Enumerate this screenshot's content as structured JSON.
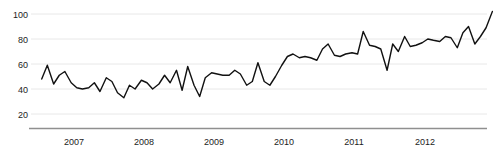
{
  "chart_data": {
    "type": "line",
    "title": "",
    "subtitle": "",
    "xlabel": "",
    "ylabel": "",
    "xlim": [
      2006.5,
      2013.0
    ],
    "ylim": [
      10,
      105
    ],
    "ytick_values": [
      100,
      80,
      60,
      40,
      20
    ],
    "ytick_labels": [
      "100",
      "80",
      "60",
      "40",
      "20"
    ],
    "xtick_values": [
      2007,
      2008,
      2009,
      2010,
      2011,
      2012
    ],
    "xtick_labels": [
      "2007",
      "2008",
      "2009",
      "2010",
      "2011",
      "2012"
    ],
    "grid": true,
    "grid_axis": "y",
    "grid_color": "#e8e8e8",
    "legend": false,
    "legend_position": "none",
    "line_color": "#111111",
    "line_width": 1.4,
    "axis_color": "#9a9a9a",
    "background": "#ffffff",
    "series": [
      {
        "name": "series-1",
        "x": [
          2006.54,
          2006.62,
          2006.71,
          2006.79,
          2006.87,
          2006.96,
          2007.04,
          2007.12,
          2007.21,
          2007.29,
          2007.37,
          2007.46,
          2007.54,
          2007.62,
          2007.71,
          2007.79,
          2007.87,
          2007.96,
          2008.04,
          2008.12,
          2008.21,
          2008.29,
          2008.37,
          2008.46,
          2008.54,
          2008.62,
          2008.71,
          2008.79,
          2008.87,
          2008.96,
          2009.04,
          2009.12,
          2009.21,
          2009.29,
          2009.37,
          2009.46,
          2009.54,
          2009.62,
          2009.71,
          2009.79,
          2009.87,
          2009.96,
          2010.04,
          2010.12,
          2010.21,
          2010.29,
          2010.37,
          2010.46,
          2010.54,
          2010.62,
          2010.71,
          2010.79,
          2010.87,
          2010.96,
          2011.04,
          2011.12,
          2011.21,
          2011.29,
          2011.37,
          2011.46,
          2011.54,
          2011.62,
          2011.71,
          2011.79,
          2011.87,
          2011.96,
          2012.04,
          2012.12,
          2012.21,
          2012.29,
          2012.37,
          2012.46,
          2012.54,
          2012.62,
          2012.71,
          2012.79,
          2012.87,
          2012.96
        ],
        "values": [
          48,
          59,
          44,
          51,
          54,
          45,
          41,
          40,
          41,
          45,
          38,
          49,
          46,
          37,
          33,
          43,
          40,
          47,
          45,
          40,
          44,
          51,
          45,
          55,
          39,
          58,
          43,
          34,
          49,
          53,
          52,
          51,
          51,
          55,
          52,
          43,
          46,
          61,
          46,
          43,
          50,
          59,
          66,
          68,
          65,
          66,
          65,
          63,
          72,
          76,
          67,
          66,
          68,
          69,
          68,
          86,
          75,
          74,
          72,
          55,
          76,
          70,
          82,
          74,
          75,
          77,
          80,
          79,
          78,
          82,
          81,
          73,
          85,
          90,
          76,
          82,
          89,
          102
        ]
      }
    ],
    "annotations": []
  },
  "axes": {
    "y_ticks": [
      {
        "label": "100",
        "top": 10,
        "value": 100
      },
      {
        "label": "80",
        "top": 35,
        "value": 80
      },
      {
        "label": "60",
        "top": 60,
        "value": 60
      },
      {
        "label": "40",
        "top": 85,
        "value": 40
      },
      {
        "label": "20",
        "top": 110,
        "value": 20
      }
    ],
    "x_ticks": [
      {
        "label": "2007",
        "left": 54,
        "value": 2007
      },
      {
        "label": "2008",
        "left": 124,
        "value": 2008
      },
      {
        "label": "2009",
        "left": 194,
        "value": 2009
      },
      {
        "label": "2010",
        "left": 264,
        "value": 2010
      },
      {
        "label": "2011",
        "left": 334,
        "value": 2011
      },
      {
        "label": "2012",
        "left": 405,
        "value": 2012
      }
    ]
  }
}
